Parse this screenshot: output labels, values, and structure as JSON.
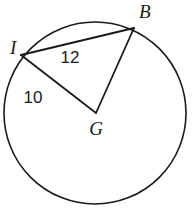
{
  "figure": {
    "background_color": "#ffffff",
    "stroke_color": "#1a1a1a",
    "circle": {
      "name": "circle-G",
      "center_x": 95,
      "center_y": 113,
      "radius": 91,
      "stroke_width": 1.6
    },
    "points": [
      {
        "id": "I",
        "label": "I",
        "x": 21,
        "y": 55,
        "label_x": 10,
        "label_y": 54
      },
      {
        "id": "B",
        "label": "B",
        "x": 134,
        "y": 28,
        "label_x": 139,
        "label_y": 18
      },
      {
        "id": "G",
        "label": "G",
        "x": 96,
        "y": 113,
        "label_x": 96,
        "label_y": 135
      }
    ],
    "segments": [
      {
        "id": "IB",
        "from": "I",
        "to": "B",
        "x1": 21,
        "y1": 55,
        "x2": 134,
        "y2": 28,
        "stroke_width": 1.8,
        "kind": "chord"
      },
      {
        "id": "GB",
        "from": "G",
        "to": "B",
        "x1": 96,
        "y1": 113,
        "x2": 134,
        "y2": 28,
        "stroke_width": 1.8,
        "kind": "radius"
      },
      {
        "id": "IG",
        "from": "I",
        "to": "G",
        "x1": 21,
        "y1": 55,
        "x2": 96,
        "y2": 113,
        "stroke_width": 1.8,
        "kind": "radius"
      }
    ],
    "measures": [
      {
        "id": "m12",
        "value": "12",
        "for_segment": "IB",
        "x": 70,
        "y": 63
      },
      {
        "id": "m10",
        "value": "10",
        "for_segment": "IG",
        "x": 33,
        "y": 103
      }
    ]
  }
}
